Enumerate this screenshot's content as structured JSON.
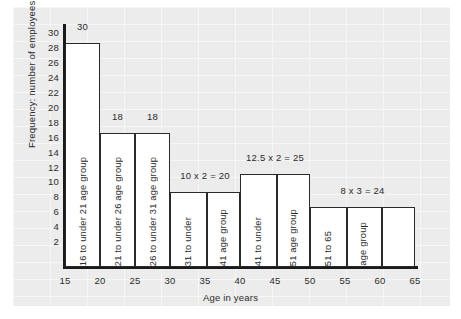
{
  "chart_data": {
    "type": "bar",
    "title": "",
    "xlabel": "Age in years",
    "ylabel": "Frequency: number of employees",
    "xlim": [
      15,
      65
    ],
    "ylim": [
      0,
      31
    ],
    "xticks": [
      15,
      20,
      25,
      30,
      35,
      40,
      45,
      50,
      55,
      60,
      65
    ],
    "yticks": [
      2,
      4,
      6,
      8,
      10,
      12,
      14,
      16,
      18,
      20,
      22,
      24,
      26,
      28,
      30
    ],
    "grid": true,
    "legend": "none",
    "bar_color": "#ffffff",
    "bar_edge_color": "#2a2a2a",
    "note": "Histogram with unequal class widths; bar height is frequency density and the annotation above each bar gives height x width = frequency.",
    "bars": [
      {
        "x_start": 15,
        "x_end": 20,
        "height": 30,
        "annotation": "30",
        "frequency": 30,
        "label_lines": [
          "16 to under 21 age group"
        ],
        "divisions": []
      },
      {
        "x_start": 20,
        "x_end": 25,
        "height": 18,
        "annotation": "18",
        "frequency": 18,
        "label_lines": [
          "21 to under 26 age group"
        ],
        "divisions": []
      },
      {
        "x_start": 25,
        "x_end": 30,
        "height": 18,
        "annotation": "18",
        "frequency": 18,
        "label_lines": [
          "26 to under 31 age group"
        ],
        "divisions": []
      },
      {
        "x_start": 30,
        "x_end": 40,
        "height": 10,
        "annotation": "10 x 2 = 20",
        "frequency": 20,
        "label_lines": [
          "31 to under",
          "41 age group"
        ],
        "divisions": [
          35
        ]
      },
      {
        "x_start": 40,
        "x_end": 50,
        "height": 12.5,
        "annotation": "12.5 x 2 = 25",
        "frequency": 25,
        "label_lines": [
          "41 to under",
          "51 age group"
        ],
        "divisions": [
          45
        ]
      },
      {
        "x_start": 50,
        "x_end": 65,
        "height": 8,
        "annotation": "8 x 3 = 24",
        "frequency": 24,
        "label_lines": [
          "51 to 65",
          "age group"
        ],
        "divisions": [
          55,
          60
        ]
      }
    ]
  }
}
